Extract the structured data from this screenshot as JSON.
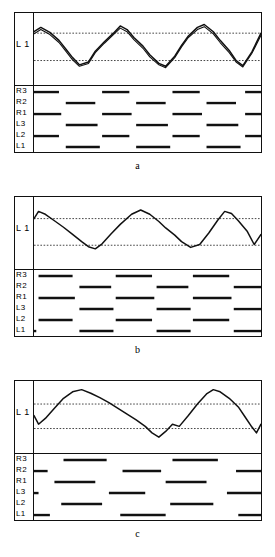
{
  "figure": {
    "panel_count": 3,
    "trace_ylabel": "L 1",
    "raster_row_labels": [
      "R3",
      "R2",
      "R1",
      "L3",
      "L2",
      "L1"
    ],
    "colors": {
      "ink": "#111111",
      "trace": "#111111",
      "dotted_reference": "#333333",
      "background": "#ffffff"
    }
  },
  "panels": [
    {
      "caption": "a",
      "chart_data": {
        "type": "line",
        "title": "",
        "xlabel": "",
        "ylabel": "L 1",
        "grid": false,
        "legend": null,
        "xlim": [
          0,
          100
        ],
        "ylim": [
          0,
          1
        ],
        "reference_lines": [
          0.72,
          0.34
        ],
        "series": [
          {
            "name": "trace-primary",
            "x": [
              0,
              3,
              7,
              11,
              14,
              17,
              20,
              24,
              27,
              31,
              35,
              38,
              41,
              44,
              48,
              51,
              55,
              58,
              62,
              65,
              68,
              72,
              75,
              79,
              82,
              86,
              89,
              92,
              96,
              100
            ],
            "y": [
              0.74,
              0.8,
              0.73,
              0.62,
              0.5,
              0.38,
              0.28,
              0.32,
              0.47,
              0.6,
              0.72,
              0.82,
              0.77,
              0.66,
              0.54,
              0.42,
              0.3,
              0.26,
              0.4,
              0.55,
              0.68,
              0.8,
              0.84,
              0.74,
              0.62,
              0.48,
              0.34,
              0.27,
              0.46,
              0.72
            ]
          },
          {
            "name": "trace-secondary",
            "x": [
              0,
              3,
              7,
              11,
              14,
              17,
              20,
              24,
              27,
              31,
              35,
              38,
              41,
              44,
              48,
              51,
              55,
              58,
              62,
              65,
              68,
              72,
              75,
              79,
              82,
              86,
              89,
              92,
              96,
              100
            ],
            "y": [
              0.71,
              0.77,
              0.7,
              0.59,
              0.47,
              0.35,
              0.26,
              0.3,
              0.45,
              0.58,
              0.7,
              0.79,
              0.74,
              0.63,
              0.51,
              0.39,
              0.28,
              0.24,
              0.38,
              0.53,
              0.66,
              0.77,
              0.81,
              0.71,
              0.59,
              0.45,
              0.32,
              0.25,
              0.44,
              0.69
            ]
          }
        ]
      },
      "raster_data": {
        "type": "raster",
        "row_labels": [
          "R3",
          "R2",
          "R1",
          "L3",
          "L2",
          "L1"
        ],
        "bursts": [
          [
            [
              0,
              11
            ],
            [
              30,
              42
            ],
            [
              61,
              73
            ],
            [
              93,
              100
            ]
          ],
          [
            [
              14,
              27
            ],
            [
              45,
              58
            ],
            [
              76,
              89
            ]
          ],
          [
            [
              0,
              12
            ],
            [
              30,
              43
            ],
            [
              61,
              74
            ],
            [
              93,
              100
            ]
          ],
          [
            [
              14,
              28
            ],
            [
              45,
              59
            ],
            [
              76,
              90
            ]
          ],
          [
            [
              0,
              11
            ],
            [
              30,
              42
            ],
            [
              61,
              73
            ],
            [
              93,
              100
            ]
          ],
          [
            [
              14,
              29
            ],
            [
              45,
              60
            ],
            [
              76,
              91
            ]
          ]
        ]
      }
    },
    {
      "caption": "b",
      "chart_data": {
        "type": "line",
        "title": "",
        "xlabel": "",
        "ylabel": "L 1",
        "grid": false,
        "legend": null,
        "xlim": [
          0,
          100
        ],
        "ylim": [
          0,
          1
        ],
        "reference_lines": [
          0.7,
          0.33
        ],
        "series": [
          {
            "name": "trace-primary",
            "x": [
              0,
              2,
              5,
              9,
              13,
              17,
              21,
              24,
              27,
              30,
              34,
              38,
              43,
              47,
              51,
              55,
              58,
              62,
              65,
              69,
              73,
              77,
              81,
              84,
              87,
              90,
              94,
              97,
              100
            ],
            "y": [
              0.7,
              0.8,
              0.76,
              0.67,
              0.58,
              0.48,
              0.38,
              0.31,
              0.28,
              0.35,
              0.49,
              0.62,
              0.76,
              0.82,
              0.76,
              0.66,
              0.57,
              0.47,
              0.38,
              0.3,
              0.34,
              0.5,
              0.68,
              0.8,
              0.77,
              0.67,
              0.52,
              0.34,
              0.48
            ]
          }
        ]
      },
      "raster_data": {
        "type": "raster",
        "row_labels": [
          "R3",
          "R2",
          "R1",
          "L3",
          "L2",
          "L1"
        ],
        "bursts": [
          [
            [
              2,
              17
            ],
            [
              36,
              52
            ],
            [
              70,
              86
            ]
          ],
          [
            [
              20,
              34
            ],
            [
              54,
              68
            ],
            [
              88,
              100
            ]
          ],
          [
            [
              2,
              18
            ],
            [
              36,
              53
            ],
            [
              70,
              87
            ]
          ],
          [
            [
              20,
              35
            ],
            [
              54,
              69
            ],
            [
              88,
              100
            ]
          ],
          [
            [
              2,
              17
            ],
            [
              36,
              52
            ],
            [
              70,
              86
            ]
          ],
          [
            [
              0,
              1
            ],
            [
              20,
              35
            ],
            [
              54,
              69
            ],
            [
              88,
              100
            ]
          ]
        ]
      }
    },
    {
      "caption": "c",
      "chart_data": {
        "type": "line",
        "title": "",
        "xlabel": "",
        "ylabel": "L 1",
        "grid": false,
        "legend": null,
        "xlim": [
          0,
          100
        ],
        "ylim": [
          0,
          1
        ],
        "reference_lines": [
          0.68,
          0.34
        ],
        "series": [
          {
            "name": "trace-primary",
            "x": [
              0,
              2,
              5,
              9,
              13,
              17,
              21,
              25,
              29,
              33,
              37,
              41,
              45,
              49,
              52,
              55,
              58,
              61,
              64,
              68,
              72,
              76,
              79,
              82,
              86,
              90,
              93,
              96,
              98,
              100
            ],
            "y": [
              0.52,
              0.4,
              0.48,
              0.62,
              0.76,
              0.85,
              0.88,
              0.83,
              0.77,
              0.7,
              0.62,
              0.54,
              0.46,
              0.37,
              0.28,
              0.22,
              0.3,
              0.4,
              0.37,
              0.52,
              0.68,
              0.82,
              0.88,
              0.85,
              0.76,
              0.64,
              0.5,
              0.36,
              0.28,
              0.4
            ]
          }
        ]
      },
      "raster_data": {
        "type": "raster",
        "row_labels": [
          "R3",
          "R2",
          "R1",
          "L3",
          "L2",
          "L1"
        ],
        "bursts": [
          [
            [
              13,
              32
            ],
            [
              61,
              81
            ]
          ],
          [
            [
              0,
              6
            ],
            [
              39,
              56
            ],
            [
              89,
              100
            ]
          ],
          [
            [
              9,
              27
            ],
            [
              58,
              76
            ]
          ],
          [
            [
              0,
              2
            ],
            [
              33,
              49
            ],
            [
              85,
              100
            ]
          ],
          [
            [
              12,
              30
            ],
            [
              60,
              79
            ]
          ],
          [
            [
              0,
              7
            ],
            [
              38,
              58
            ],
            [
              90,
              100
            ]
          ]
        ]
      }
    }
  ]
}
